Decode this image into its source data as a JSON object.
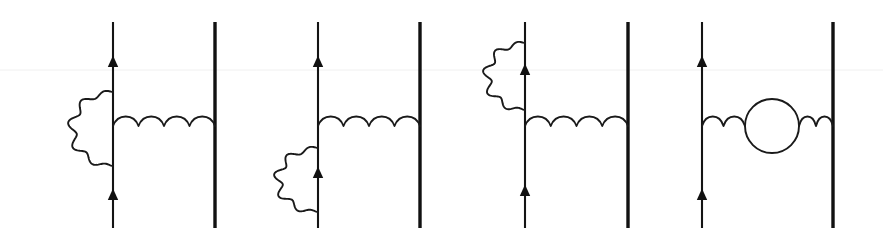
{
  "figure": {
    "width": 883,
    "height": 243,
    "background_color": "#ffffff",
    "line_color": "#141414",
    "wave_color": "#1a1a1a",
    "heavy_line_color": "#111111"
  },
  "geometry": {
    "line_top_y": 22,
    "line_bottom_y": 228,
    "photon_baseline_y": 126,
    "wave_amplitude": 10,
    "fermion_stroke_width": 2.1,
    "heavy_stroke_width": 3.4,
    "wave_stroke_width": 1.9
  },
  "diagrams": [
    {
      "index": 1,
      "name": "vertex-correction-upper-left",
      "description": "Self-energy / vertex-correction photon loop on the left fermion line above the exchange vertex",
      "left_line_x": 113,
      "right_line_x": 215,
      "right_line_heavy": true,
      "left_arrow_ys": [
        67,
        200
      ],
      "photon": {
        "x_start": 113,
        "x_end": 215,
        "arches": 4,
        "baseline_y": 126
      },
      "loop": {
        "kind": "wavy-arc",
        "attach_top_y": 92,
        "attach_bottom_y": 166,
        "bulge_x": 72,
        "side": "left",
        "waves": 5
      }
    },
    {
      "index": 2,
      "name": "vertex-correction-lower-left",
      "description": "Self-energy photon loop on the left fermion line below the exchange vertex",
      "left_line_x": 318,
      "right_line_x": 420,
      "right_line_heavy": true,
      "left_arrow_ys": [
        67,
        178
      ],
      "photon": {
        "x_start": 318,
        "x_end": 420,
        "arches": 4,
        "baseline_y": 126
      },
      "loop": {
        "kind": "wavy-arc",
        "attach_top_y": 148,
        "attach_bottom_y": 212,
        "bulge_x": 278,
        "side": "left",
        "waves": 5
      }
    },
    {
      "index": 3,
      "name": "self-energy-upper-left",
      "description": "Self-energy photon loop high on the upper left fermion line, photon exchange below",
      "left_line_x": 525,
      "right_line_x": 628,
      "right_line_heavy": true,
      "left_arrow_ys": [
        75,
        196
      ],
      "photon": {
        "x_start": 525,
        "x_end": 628,
        "arches": 4,
        "baseline_y": 126
      },
      "loop": {
        "kind": "wavy-arc",
        "attach_top_y": 43,
        "attach_bottom_y": 110,
        "bulge_x": 487,
        "side": "left",
        "waves": 5
      }
    },
    {
      "index": 4,
      "name": "vacuum-polarization",
      "description": "Vacuum polarization fermion loop inserted in the exchanged photon propagator",
      "left_line_x": 702,
      "right_line_x": 833,
      "right_line_heavy": true,
      "left_arrow_ys": [
        67,
        200
      ],
      "photon": {
        "x_start": 702,
        "x_end": 833,
        "baseline_y": 126,
        "left_segment_arches": 2,
        "right_segment_arches": 1
      },
      "loop": {
        "kind": "circle",
        "center_x": 772,
        "center_y": 126,
        "radius": 27
      }
    }
  ],
  "artifacts": {
    "scan_line_y": 70,
    "scan_line_color": "#f0f0f0"
  }
}
